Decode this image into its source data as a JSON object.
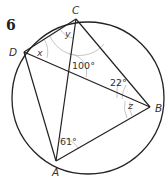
{
  "question": {
    "number": "6"
  },
  "points": {
    "A": {
      "label": "A",
      "x": 56,
      "y": 161
    },
    "B": {
      "label": "B",
      "x": 150,
      "y": 107
    },
    "C": {
      "label": "C",
      "x": 76,
      "y": 19
    },
    "D": {
      "label": "D",
      "x": 24,
      "y": 52
    }
  },
  "circle": {
    "cx": 88,
    "cy": 98,
    "r": 76
  },
  "segments": [
    "CD",
    "CB",
    "DB",
    "CA",
    "DA",
    "AB"
  ],
  "angles": {
    "x": {
      "label": "x",
      "at": "D",
      "between": "DC-DB"
    },
    "y": {
      "label": "y",
      "at": "C",
      "between": "CD-CA"
    },
    "center": {
      "label": "100°",
      "at": "intersection of AC and DB"
    },
    "cbd": {
      "label": "22°",
      "at": "B",
      "between": "BC-BD"
    },
    "z": {
      "label": "z",
      "at": "B",
      "between": "BD-BA"
    },
    "cab": {
      "label": "61°",
      "at": "A",
      "between": "AC-AB"
    }
  },
  "colors": {
    "lines": "#222222",
    "angle_arcs": "#b8b8b8",
    "text": "#333333"
  }
}
